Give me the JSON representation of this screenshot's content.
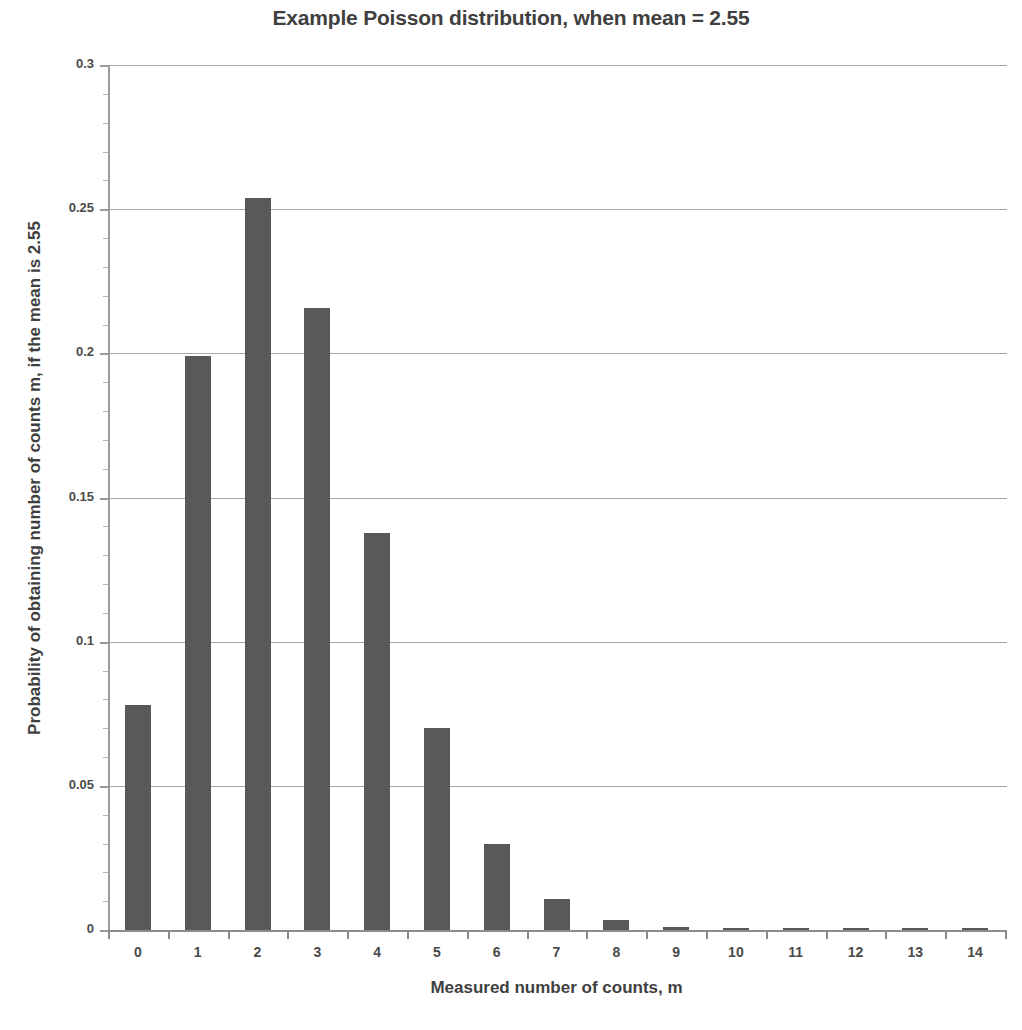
{
  "chart_data": {
    "type": "bar",
    "title": "Example Poisson distribution, when mean = 2.55",
    "xlabel": "Measured number of counts, m",
    "ylabel": "Probability of obtaining number of counts m, if the mean is 2.55",
    "categories": [
      "0",
      "1",
      "2",
      "3",
      "4",
      "5",
      "6",
      "7",
      "8",
      "9",
      "10",
      "11",
      "12",
      "13",
      "14"
    ],
    "values": [
      0.0781,
      0.1992,
      0.254,
      0.2159,
      0.1376,
      0.0702,
      0.0298,
      0.0109,
      0.0035,
      0.001,
      0.0003,
      0.0001,
      2e-05,
      4e-06,
      7e-07
    ],
    "ylim": [
      0,
      0.3
    ],
    "ytick_labels": [
      "0",
      "0.05",
      "0.1",
      "0.15",
      "0.2",
      "0.25",
      "0.3"
    ],
    "ytick_values": [
      0,
      0.05,
      0.1,
      0.15,
      0.2,
      0.25,
      0.3
    ],
    "grid": true,
    "legend": "none",
    "bar_color": "#595959",
    "grid_color": "#a6a6a6",
    "axis_color": "#8c8c8c"
  }
}
